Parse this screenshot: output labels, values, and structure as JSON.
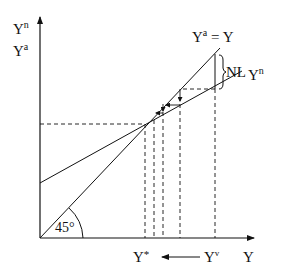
{
  "diagram": {
    "y_axis_labels": {
      "top": {
        "base": "Y",
        "sup": "n"
      },
      "bottom": {
        "base": "Y",
        "sup": "a"
      }
    },
    "x_axis_label": "Y",
    "line_45": {
      "label_base": "Y",
      "label_sup": "a",
      "label_rest": " = Y"
    },
    "line_n": {
      "label_base": "Y",
      "label_sup": "n"
    },
    "gap_label": "NL",
    "angle_label": "45°",
    "equilibrium_label": {
      "base": "Y",
      "sup": "*"
    },
    "start_label": {
      "base": "Y",
      "sup": "v"
    },
    "colors": {
      "line": "#111111",
      "background": "#ffffff"
    }
  }
}
